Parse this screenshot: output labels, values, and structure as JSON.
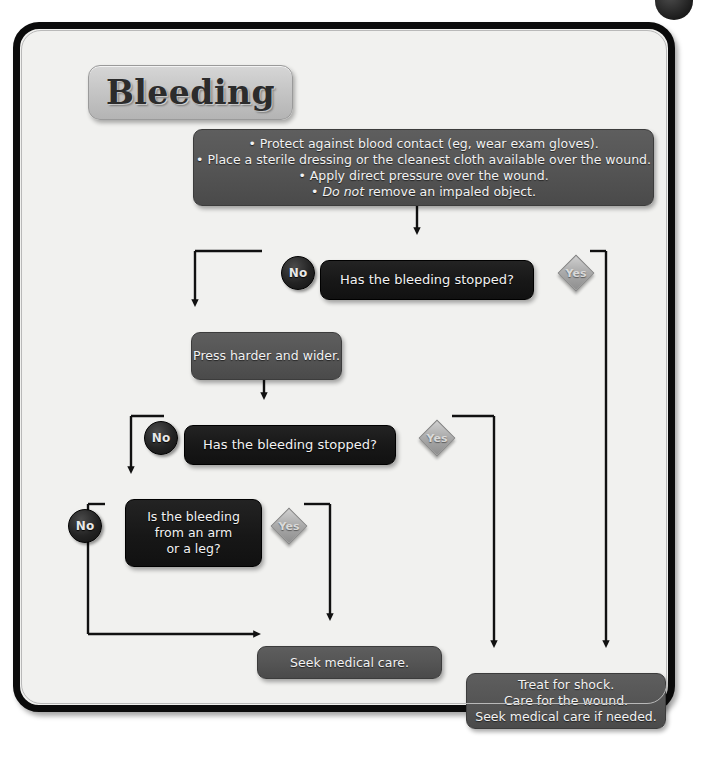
{
  "page": {
    "title": "Bleeding",
    "ghost_text": "Bleeding (cont.)"
  },
  "nodes": {
    "instructions": {
      "id": "instructions",
      "kind": "action",
      "lines": [
        "• Protect against blood contact (eg, wear exam gloves).",
        "• Place a sterile dressing or the cleanest cloth available over the wound.",
        "• Apply direct pressure over the wound.",
        "• Do not remove an impaled object."
      ],
      "italic_line_index": 3,
      "italic_part": "Do not"
    },
    "q1": {
      "id": "q1",
      "kind": "decision",
      "lines": [
        "Has the bleeding stopped?"
      ]
    },
    "press": {
      "id": "press",
      "kind": "action",
      "lines": [
        "Press harder and wider."
      ]
    },
    "q2": {
      "id": "q2",
      "kind": "decision",
      "lines": [
        "Has the bleeding stopped?"
      ]
    },
    "q3": {
      "id": "q3",
      "kind": "decision",
      "lines": [
        "Is the bleeding",
        "from an arm",
        "or a leg?"
      ]
    },
    "seek": {
      "id": "seek",
      "kind": "action",
      "lines": [
        "Seek medical care."
      ]
    },
    "shock": {
      "id": "shock",
      "kind": "action",
      "lines": [
        "Treat for shock.",
        "Care for the wound.",
        "Seek medical care if needed."
      ]
    }
  },
  "branch_labels": {
    "no": "No",
    "yes": "Yes"
  },
  "branches": [
    {
      "from": "q1",
      "label": "No",
      "to": "press"
    },
    {
      "from": "q1",
      "label": "Yes",
      "to": "shock"
    },
    {
      "from": "q2",
      "label": "No",
      "to": "q3"
    },
    {
      "from": "q2",
      "label": "Yes",
      "to": "shock"
    },
    {
      "from": "q3",
      "label": "No",
      "to": "seek"
    },
    {
      "from": "q3",
      "label": "Yes",
      "to": "seek"
    }
  ],
  "colors": {
    "action_box": "#545454",
    "decision_box": "#171717",
    "yes_diamond": "#a9a9a9",
    "no_circle": "#232323",
    "frame_border": "#0b0b0b",
    "page_bg": "#f1f1ef",
    "text": "#f2f2f2"
  }
}
